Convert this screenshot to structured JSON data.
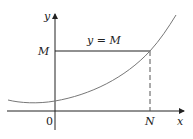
{
  "diagram": {
    "labels": {
      "y_axis": "y",
      "x_axis": "x",
      "origin": "0",
      "m_tick": "M",
      "n_tick": "N",
      "line_label": "y = M"
    },
    "colors": {
      "axis": "#222222",
      "curve": "#777777",
      "bound_line": "#222222",
      "dashed": "#555555"
    }
  }
}
